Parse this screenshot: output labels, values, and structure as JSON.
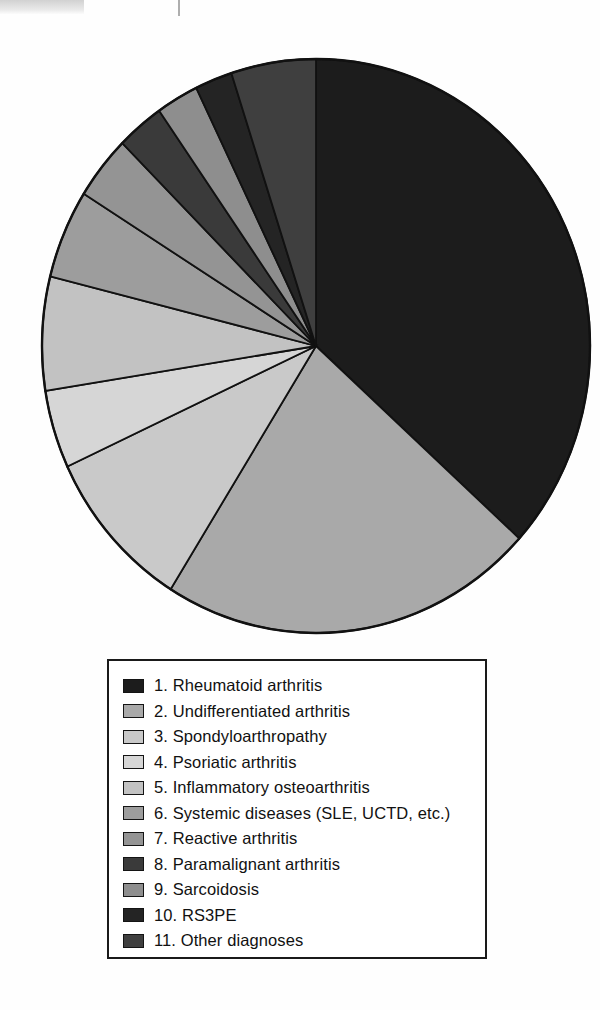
{
  "figure": {
    "type": "pie-chart-with-legend",
    "background": "#ffffff",
    "outline_color": "#111111"
  },
  "chart_data": {
    "type": "pie",
    "title": "",
    "subtitle": "",
    "xlabel": "",
    "ylabel": "",
    "legend_position": "below",
    "grid": false,
    "start_angle_deg": 0,
    "direction": "clockwise",
    "labels": [
      "1. Rheumatoid arthritis",
      "2. Undifferentiated arthritis",
      "3. Spondyloarthropathy",
      "4. Psoriatic arthritis",
      "5. Inflammatory osteoarthritis",
      "6. Systemic diseases (SLE, UCTD, etc.)",
      "7. Reactive arthritis",
      "8. Paramalignant arthritis",
      "9. Sarcoidosis",
      "10. RS3PE",
      "11. Other diagnoses"
    ],
    "values": [
      36.7,
      22.2,
      9.2,
      4.4,
      6.4,
      5.0,
      3.6,
      2.8,
      2.5,
      2.2,
      5.0
    ],
    "value_unit": "percent",
    "colors": [
      "#1c1c1c",
      "#a9a9a9",
      "#c9c9c9",
      "#d6d6d6",
      "#c2c2c2",
      "#9d9d9d",
      "#949494",
      "#3a3a3a",
      "#8e8e8e",
      "#242424",
      "#3f3f3f"
    ]
  },
  "legend": {
    "items": [
      {
        "index": "1",
        "label": "1. Rheumatoid arthritis",
        "color": "#1c1c1c"
      },
      {
        "index": "2",
        "label": "2. Undifferentiated arthritis",
        "color": "#a9a9a9"
      },
      {
        "index": "3",
        "label": "3. Spondyloarthropathy",
        "color": "#c9c9c9"
      },
      {
        "index": "4",
        "label": "4. Psoriatic arthritis",
        "color": "#d6d6d6"
      },
      {
        "index": "5",
        "label": "5. Inflammatory osteoarthritis",
        "color": "#c2c2c2"
      },
      {
        "index": "6",
        "label": "6. Systemic diseases (SLE, UCTD, etc.)",
        "color": "#9d9d9d"
      },
      {
        "index": "7",
        "label": "7. Reactive arthritis",
        "color": "#949494"
      },
      {
        "index": "8",
        "label": "8. Paramalignant arthritis",
        "color": "#3a3a3a"
      },
      {
        "index": "9",
        "label": "9. Sarcoidosis",
        "color": "#8e8e8e"
      },
      {
        "index": "10",
        "label": "10. RS3PE",
        "color": "#242424"
      },
      {
        "index": "11",
        "label": "11. Other diagnoses",
        "color": "#3f3f3f"
      }
    ]
  }
}
